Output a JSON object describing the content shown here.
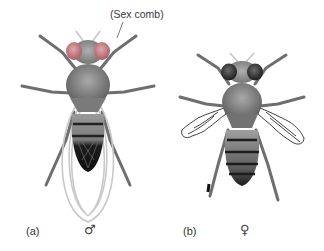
{
  "figure": {
    "callout": "(Sex comb)",
    "panels": [
      {
        "id": "a",
        "label": "(a)",
        "sex_symbol": "♂",
        "sex": "male",
        "eye_color": "#c9848a",
        "wings": "normal"
      },
      {
        "id": "b",
        "label": "(b)",
        "sex_symbol": "♀",
        "sex": "female",
        "eye_color": "#2e2e2e",
        "wings": "vestigial"
      }
    ]
  },
  "colors": {
    "background": "#ffffff",
    "body": "#8a8a8a",
    "dark": "#1e1e1e",
    "wing_outline": "#c8c8c8"
  }
}
